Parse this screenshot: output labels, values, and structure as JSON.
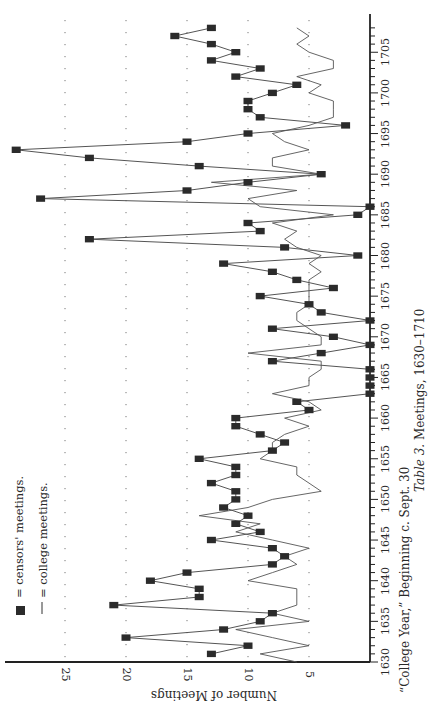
{
  "caption": {
    "table_label": "Table 3.",
    "title": "Meetings, 1630–1710",
    "subtitle": "“College Year,” Beginning c. Sept. 30"
  },
  "legend": {
    "censors_label": "= censors' meetings.",
    "college_label": "= college meetings."
  },
  "colors": {
    "line": "#555555",
    "marker": "#2b2b2b",
    "axis": "#222222",
    "grid_dot": "#777777"
  },
  "chart_data": {
    "type": "line",
    "title": "Table 3. Meetings, 1630–1710",
    "xlabel": "“College Year,” Beginning c. Sept. 30",
    "ylabel": "Number of Meetings",
    "orientation": "rotated 90° clockwise (years run bottom-to-top, meetings increase right-to-left)",
    "x_ticks": [
      1630,
      1635,
      1640,
      1645,
      1650,
      1655,
      1660,
      1665,
      1670,
      1675,
      1680,
      1685,
      1690,
      1695,
      1700,
      1705
    ],
    "y_ticks": [
      5,
      10,
      15,
      20,
      25
    ],
    "xlim": [
      1630,
      1710
    ],
    "ylim": [
      0,
      30
    ],
    "grid": "dotted horizontal lines at 5, 10, 15, 20, 25",
    "legend_position": "upper-left (bottom-left in rotated page)",
    "series": [
      {
        "name": "censors' meetings",
        "style": "line with square markers",
        "x": [
          1631,
          1632,
          1633,
          1634,
          1635,
          1636,
          1637,
          1638,
          1639,
          1640,
          1641,
          1642,
          1643,
          1644,
          1645,
          1646,
          1647,
          1648,
          1649,
          1650,
          1651,
          1652,
          1653,
          1654,
          1655,
          1656,
          1657,
          1658,
          1659,
          1660,
          1661,
          1662,
          1663,
          1664,
          1665,
          1666,
          1667,
          1668,
          1669,
          1670,
          1671,
          1672,
          1673,
          1674,
          1675,
          1676,
          1677,
          1678,
          1679,
          1680,
          1681,
          1682,
          1683,
          1684,
          1685,
          1686,
          1687,
          1688,
          1689,
          1690,
          1691,
          1692,
          1693,
          1694,
          1695,
          1696,
          1697,
          1698,
          1699,
          1700,
          1701,
          1702,
          1703,
          1704,
          1705,
          1706,
          1707,
          1708
        ],
        "values": [
          13,
          10,
          20,
          12,
          9,
          8,
          21,
          14,
          14,
          18,
          15,
          8,
          7,
          8,
          13,
          9,
          11,
          10,
          12,
          11,
          11,
          13,
          11,
          11,
          14,
          8,
          7,
          9,
          11,
          11,
          5,
          6,
          0,
          0,
          0,
          0,
          8,
          4,
          0,
          3,
          8,
          0,
          4,
          5,
          9,
          3,
          6,
          8,
          12,
          1,
          7,
          23,
          9,
          10,
          1,
          0,
          27,
          15,
          10,
          4,
          14,
          23,
          29,
          15,
          10,
          2,
          9,
          10,
          10,
          8,
          6,
          11,
          9,
          13,
          11,
          13,
          16,
          13
        ]
      },
      {
        "name": "college meetings",
        "style": "thin line",
        "x": [
          1630,
          1631,
          1632,
          1633,
          1634,
          1635,
          1636,
          1637,
          1638,
          1639,
          1640,
          1641,
          1642,
          1643,
          1644,
          1645,
          1646,
          1647,
          1648,
          1649,
          1650,
          1651,
          1652,
          1653,
          1654,
          1655,
          1656,
          1657,
          1658,
          1659,
          1660,
          1661,
          1662,
          1663,
          1664,
          1665,
          1666,
          1667,
          1668,
          1669,
          1670,
          1671,
          1672,
          1673,
          1674,
          1675,
          1676,
          1677,
          1678,
          1679,
          1680,
          1681,
          1682,
          1683,
          1684,
          1685,
          1686,
          1687,
          1688,
          1689,
          1690,
          1691,
          1692,
          1693,
          1694,
          1695,
          1696,
          1697,
          1698,
          1699,
          1700,
          1701,
          1702,
          1703,
          1704,
          1705,
          1706,
          1707,
          1708
        ],
        "values": [
          6,
          9,
          5,
          8,
          11,
          5,
          8,
          6,
          6,
          6,
          10,
          8,
          6,
          7,
          5,
          8,
          11,
          9,
          14,
          10,
          8,
          4,
          5,
          6,
          6,
          9,
          8,
          8,
          7,
          5,
          7,
          4,
          5,
          8,
          5,
          5,
          4,
          4,
          10,
          4,
          4,
          5,
          6,
          6,
          5,
          5,
          5,
          5,
          4,
          5,
          4,
          6,
          7,
          6,
          8,
          3,
          9,
          10,
          6,
          13,
          4,
          8,
          8,
          5,
          7,
          8,
          5,
          3,
          3,
          3,
          5,
          4,
          6,
          3,
          3,
          5,
          6,
          5,
          6
        ]
      }
    ]
  }
}
